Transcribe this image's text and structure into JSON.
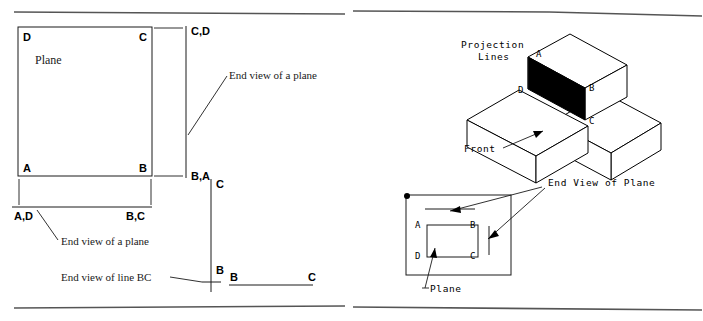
{
  "figure": {
    "ink_color": "#1a1a1a",
    "rule_color": "#555555",
    "shaded_face_color": "#000000",
    "paper_color": "#ffffff"
  },
  "left_panel": {
    "name": "orthographic-projection-panel",
    "plane_label": "Plane",
    "corner_labels": {
      "top_left": "D",
      "top_right": "C",
      "bottom_left": "A",
      "bottom_right": "B"
    },
    "side_view_labels": {
      "top": "C,D",
      "bottom": "B,A"
    },
    "bottom_view_labels": {
      "left": "A,D",
      "right": "B,C"
    },
    "line_view_labels": {
      "vertical_top": "C",
      "vertical_bottom": "B",
      "horizontal_left": "B",
      "horizontal_right": "C"
    },
    "annotations": {
      "end_view_right": "End view of a plane",
      "end_view_bottom": "End view of a plane",
      "end_view_line": "End view of line BC"
    }
  },
  "right_panel": {
    "name": "pictorial-projection-panel",
    "isometric": {
      "projection_lines_label": "Projection\nLines",
      "projection_lines_line1": "Projection",
      "projection_lines_line2": "Lines",
      "front_label": "Front",
      "face_vertices": {
        "top_left": "A",
        "bottom_left": "D",
        "right_top": "B",
        "right_bottom": "C"
      }
    },
    "ortho_view": {
      "inner_plane_labels": {
        "top_left": "A",
        "top_right": "B",
        "bottom_left": "D",
        "bottom_right": "C"
      },
      "plane_label": "Plane",
      "end_view_label": "End View of Plane"
    }
  }
}
